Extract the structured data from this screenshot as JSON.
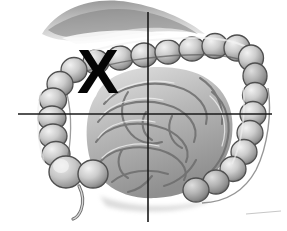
{
  "image": {
    "kind": "anatomical-illustration",
    "subject": "intestines",
    "description": "Grayscale medical drawing of the large intestine (colon) surrounding coiled small intestine, viewed from the front",
    "width": 287,
    "height": 231,
    "background_color": "#ffffff",
    "rendering": "grayscale-pencil-shading"
  },
  "annotation": {
    "mark_label": "X",
    "mark_color": "#050505",
    "mark_position": {
      "x": 98,
      "y": 73
    },
    "quadrant": "upper-left"
  },
  "crosshair": {
    "line_color": "#1a1a1a",
    "line_width_px": 1.6,
    "intersection": {
      "x": 148,
      "y": 114
    },
    "vertical": {
      "x": 148,
      "y_start": 12,
      "y_end": 222
    },
    "horizontal": {
      "y": 114,
      "x_start": 18,
      "x_end": 272
    }
  },
  "anatomy": {
    "palette": {
      "outline": "#4a4a4a",
      "mid_tone": "#9c9c9c",
      "light_tone": "#d2d2d2",
      "highlight": "#f0f0f0",
      "shadow": "#6b6b6b",
      "deep_shadow": "#474747"
    },
    "structures": [
      {
        "name": "transverse-colon",
        "note": "runs across the upper field with haustral sacculations"
      },
      {
        "name": "hepatic-flexure",
        "note": "right-sided bend at the upper right of the image"
      },
      {
        "name": "splenic-flexure",
        "note": "bend at the upper left of the image"
      },
      {
        "name": "ascending-colon",
        "note": "vertical segment on the right side of the image"
      },
      {
        "name": "descending-colon",
        "note": "vertical segment on the left side of the image"
      },
      {
        "name": "cecum",
        "note": "rounded pouch at the lower left"
      },
      {
        "name": "appendix",
        "note": "slender worm-like tube hanging from the cecum"
      },
      {
        "name": "small-intestine",
        "note": "coiled loops of jejunum and ileum filling the center"
      },
      {
        "name": "greater-omentum",
        "note": "shaded drape across the top of the field"
      }
    ]
  }
}
